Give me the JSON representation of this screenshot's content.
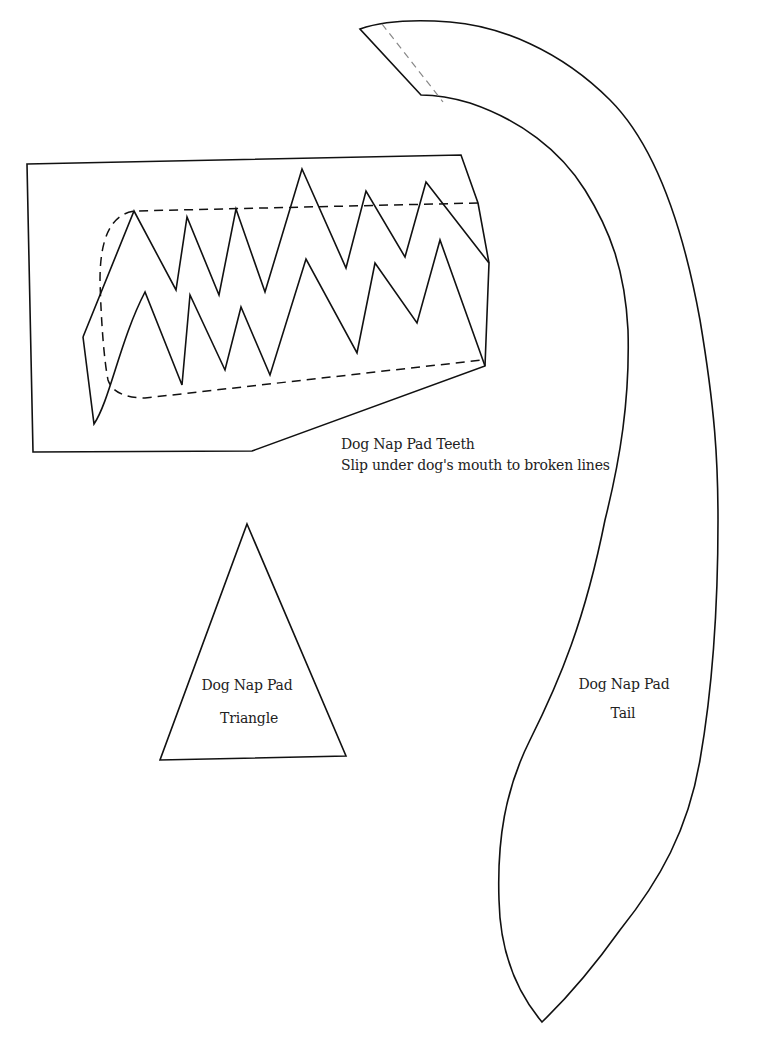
{
  "pieces": {
    "teeth": {
      "title": "Dog Nap Pad Teeth",
      "instruction": "Slip under dog's mouth to broken lines"
    },
    "triangle": {
      "line1": "Dog Nap Pad",
      "line2": "Triangle"
    },
    "tail": {
      "line1": "Dog Nap Pad",
      "line2": "Tail"
    }
  },
  "colors": {
    "line": "#111111",
    "background": "#ffffff",
    "fold_dash": "#888888"
  }
}
